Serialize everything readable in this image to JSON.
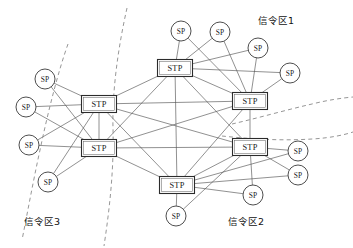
{
  "figure": {
    "width": 353,
    "height": 248,
    "background_color": "#ffffff"
  },
  "colors": {
    "edge": "#555555",
    "zone_boundary": "#8a8a8a",
    "node_stroke": "#2b2b2b",
    "node_fill": "#ffffff",
    "text": "#111111"
  },
  "zone_labels": [
    {
      "id": "zone-1",
      "text": "信令区1",
      "x": 258,
      "y": 20,
      "anchor": "start"
    },
    {
      "id": "zone-2",
      "text": "信令区2",
      "x": 228,
      "y": 221,
      "anchor": "start"
    },
    {
      "id": "zone-3",
      "text": "信令区3",
      "x": 24,
      "y": 221,
      "anchor": "start"
    }
  ],
  "stp_nodes": [
    {
      "id": "stp-top",
      "label": "STP",
      "x": 175,
      "y": 68,
      "w": 35,
      "h": 17
    },
    {
      "id": "stp-right-upper",
      "label": "STP",
      "x": 250,
      "y": 101,
      "w": 35,
      "h": 17
    },
    {
      "id": "stp-left-upper",
      "label": "STP",
      "x": 99,
      "y": 104,
      "w": 35,
      "h": 17
    },
    {
      "id": "stp-left-lower",
      "label": "STP",
      "x": 99,
      "y": 148,
      "w": 35,
      "h": 17
    },
    {
      "id": "stp-right-lower",
      "label": "STP",
      "x": 250,
      "y": 147,
      "w": 35,
      "h": 17
    },
    {
      "id": "stp-bottom",
      "label": "STP",
      "x": 177,
      "y": 185,
      "w": 35,
      "h": 17
    }
  ],
  "sp_nodes": [
    {
      "id": "sp-top-1",
      "label": "SP",
      "x": 181,
      "y": 31,
      "r": 10
    },
    {
      "id": "sp-top-2",
      "label": "SP",
      "x": 220,
      "y": 32,
      "r": 10
    },
    {
      "id": "sp-top-3",
      "label": "SP",
      "x": 258,
      "y": 48,
      "r": 10
    },
    {
      "id": "sp-right-1",
      "label": "SP",
      "x": 290,
      "y": 73,
      "r": 10
    },
    {
      "id": "sp-right-2",
      "label": "SP",
      "x": 298,
      "y": 151,
      "r": 10
    },
    {
      "id": "sp-right-3",
      "label": "SP",
      "x": 298,
      "y": 175,
      "r": 10
    },
    {
      "id": "sp-bottom-r",
      "label": "SP",
      "x": 253,
      "y": 195,
      "r": 10
    },
    {
      "id": "sp-bottom-c",
      "label": "SP",
      "x": 176,
      "y": 216,
      "r": 10
    },
    {
      "id": "sp-left-1",
      "label": "SP",
      "x": 45,
      "y": 79,
      "r": 10
    },
    {
      "id": "sp-left-2",
      "label": "SP",
      "x": 26,
      "y": 107,
      "r": 10
    },
    {
      "id": "sp-left-3",
      "label": "SP",
      "x": 29,
      "y": 145,
      "r": 10
    },
    {
      "id": "sp-left-4",
      "label": "SP",
      "x": 48,
      "y": 182,
      "r": 10
    }
  ],
  "edges": [
    {
      "from": "stp-top",
      "to": "stp-right-upper"
    },
    {
      "from": "stp-top",
      "to": "stp-left-upper"
    },
    {
      "from": "stp-top",
      "to": "stp-left-lower"
    },
    {
      "from": "stp-top",
      "to": "stp-right-lower"
    },
    {
      "from": "stp-top",
      "to": "stp-bottom"
    },
    {
      "from": "stp-right-upper",
      "to": "stp-left-upper"
    },
    {
      "from": "stp-right-upper",
      "to": "stp-left-lower"
    },
    {
      "from": "stp-right-upper",
      "to": "stp-right-lower"
    },
    {
      "from": "stp-right-upper",
      "to": "stp-bottom"
    },
    {
      "from": "stp-left-upper",
      "to": "stp-left-lower"
    },
    {
      "from": "stp-left-upper",
      "to": "stp-right-lower"
    },
    {
      "from": "stp-left-upper",
      "to": "stp-bottom"
    },
    {
      "from": "stp-left-lower",
      "to": "stp-right-lower"
    },
    {
      "from": "stp-left-lower",
      "to": "stp-bottom"
    },
    {
      "from": "stp-right-lower",
      "to": "stp-bottom"
    },
    {
      "from": "sp-top-1",
      "to": "stp-top"
    },
    {
      "from": "sp-top-1",
      "to": "stp-right-upper"
    },
    {
      "from": "sp-top-2",
      "to": "stp-top"
    },
    {
      "from": "sp-top-2",
      "to": "stp-right-upper"
    },
    {
      "from": "sp-top-3",
      "to": "stp-top"
    },
    {
      "from": "sp-top-3",
      "to": "stp-right-upper"
    },
    {
      "from": "sp-right-1",
      "to": "stp-top"
    },
    {
      "from": "sp-right-1",
      "to": "stp-right-upper"
    },
    {
      "from": "sp-right-2",
      "to": "stp-right-lower"
    },
    {
      "from": "sp-right-2",
      "to": "stp-bottom"
    },
    {
      "from": "sp-right-3",
      "to": "stp-right-lower"
    },
    {
      "from": "sp-right-3",
      "to": "stp-bottom"
    },
    {
      "from": "sp-bottom-r",
      "to": "stp-right-lower"
    },
    {
      "from": "sp-bottom-r",
      "to": "stp-bottom"
    },
    {
      "from": "sp-bottom-c",
      "to": "stp-bottom"
    },
    {
      "from": "sp-bottom-c",
      "to": "stp-right-lower"
    },
    {
      "from": "sp-left-1",
      "to": "stp-left-upper"
    },
    {
      "from": "sp-left-1",
      "to": "stp-left-lower"
    },
    {
      "from": "sp-left-2",
      "to": "stp-left-upper"
    },
    {
      "from": "sp-left-2",
      "to": "stp-left-lower"
    },
    {
      "from": "sp-left-3",
      "to": "stp-left-upper"
    },
    {
      "from": "sp-left-3",
      "to": "stp-left-lower"
    },
    {
      "from": "sp-left-4",
      "to": "stp-left-upper"
    },
    {
      "from": "sp-left-4",
      "to": "stp-left-lower"
    }
  ],
  "zone_boundaries": [
    {
      "id": "boundary-left-outer",
      "d": "M 68,44 C 58,72 48,112 40,150 C 33,182 28,210 22,240"
    },
    {
      "id": "boundary-left-inner",
      "d": "M 127,8 C 118,48 112,92 113,128 C 114,168 110,206 104,246"
    },
    {
      "id": "boundary-right-upper",
      "d": "M 232,124 C 258,118 286,110 312,104 C 328,100 342,98 353,97"
    },
    {
      "id": "boundary-right-lower",
      "d": "M 222,136 C 250,139 282,141 312,139 C 330,138 344,135 353,132"
    }
  ]
}
